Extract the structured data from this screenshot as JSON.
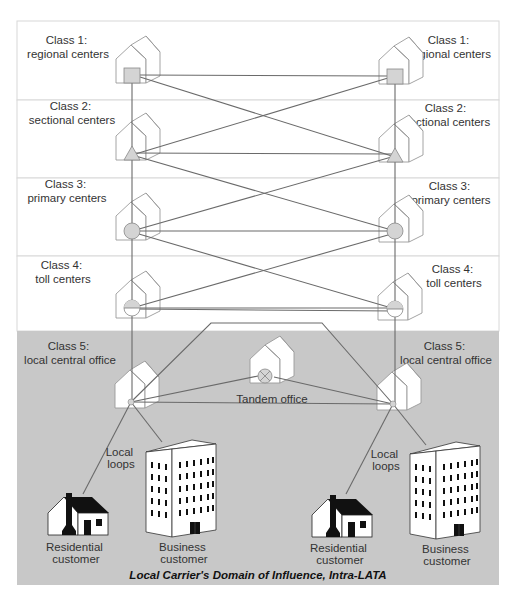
{
  "diagram": {
    "colors": {
      "band_bg": "#ffffff",
      "band_border": "#d8d8d8",
      "domain_bg": "#c8c8c8",
      "link": "#6a6a6a",
      "symbol_fill": "#d4d4d4",
      "house_outline": "#9a9a9a"
    },
    "bands": [
      {
        "id": "class1",
        "left_label": [
          "Class 1:",
          "regional centers"
        ],
        "right_label": [
          "Class 1:",
          "regional centers"
        ],
        "symbol": "square"
      },
      {
        "id": "class2",
        "left_label": [
          "Class 2:",
          "sectional centers"
        ],
        "right_label": [
          "Class 2:",
          "sectional centers"
        ],
        "symbol": "triangle"
      },
      {
        "id": "class3",
        "left_label": [
          "Class 3:",
          "primary centers"
        ],
        "right_label": [
          "Class 3:",
          "primary centers"
        ],
        "symbol": "circle"
      },
      {
        "id": "class4",
        "left_label": [
          "Class 4:",
          "toll centers"
        ],
        "right_label": [
          "Class 4:",
          "toll centers"
        ],
        "symbol": "half-circle"
      },
      {
        "id": "class5",
        "left_label": [
          "Class 5:",
          "local central office"
        ],
        "right_label": [
          "Class 5:",
          "local central office"
        ],
        "symbol": "dot"
      }
    ],
    "tandem": {
      "label": "Tandem office",
      "symbol": "x-circle"
    },
    "customers": {
      "left": {
        "loops_label": [
          "Local",
          "loops"
        ],
        "residential_label": [
          "Residential",
          "customer"
        ],
        "business_label": [
          "Business",
          "customer"
        ]
      },
      "right": {
        "loops_label": [
          "Local",
          "loops"
        ],
        "residential_label": [
          "Residential",
          "customer"
        ],
        "business_label": [
          "Business",
          "customer"
        ]
      }
    },
    "domain_caption": "Local Carrier's Domain of Influence, Intra-LATA"
  }
}
